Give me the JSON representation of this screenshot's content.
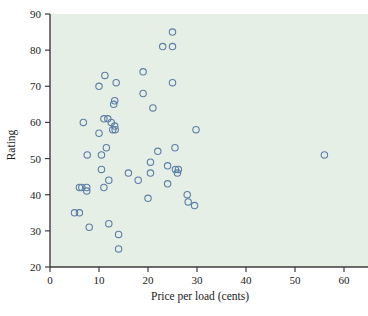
{
  "chart_data": {
    "type": "scatter",
    "title": "",
    "xlabel": "Price per load (cents)",
    "ylabel": "Rating",
    "xlim": [
      0,
      60
    ],
    "ylim": [
      20,
      90
    ],
    "xticks": [
      0,
      10,
      20,
      30,
      40,
      50,
      60
    ],
    "yticks": [
      20,
      30,
      40,
      50,
      60,
      70,
      80,
      90
    ],
    "grid": false,
    "legend": null,
    "marker_style": "open-circle",
    "marker_color": "#5b7fa6",
    "plot_background": "#e6efe6",
    "points": [
      {
        "x": 5,
        "y": 35
      },
      {
        "x": 6,
        "y": 35
      },
      {
        "x": 6,
        "y": 42
      },
      {
        "x": 6.5,
        "y": 42
      },
      {
        "x": 6.8,
        "y": 60
      },
      {
        "x": 7.5,
        "y": 42
      },
      {
        "x": 7.5,
        "y": 41
      },
      {
        "x": 7.6,
        "y": 51
      },
      {
        "x": 8,
        "y": 31
      },
      {
        "x": 10,
        "y": 57
      },
      {
        "x": 10,
        "y": 70
      },
      {
        "x": 10.5,
        "y": 51
      },
      {
        "x": 10.5,
        "y": 47
      },
      {
        "x": 11,
        "y": 42
      },
      {
        "x": 11,
        "y": 61
      },
      {
        "x": 11.2,
        "y": 73
      },
      {
        "x": 11.5,
        "y": 53
      },
      {
        "x": 11.8,
        "y": 61
      },
      {
        "x": 12,
        "y": 44
      },
      {
        "x": 12,
        "y": 32
      },
      {
        "x": 12.5,
        "y": 60
      },
      {
        "x": 12.8,
        "y": 58
      },
      {
        "x": 13,
        "y": 65
      },
      {
        "x": 13.2,
        "y": 66
      },
      {
        "x": 13.2,
        "y": 59
      },
      {
        "x": 13.3,
        "y": 58
      },
      {
        "x": 13.5,
        "y": 71
      },
      {
        "x": 14,
        "y": 29
      },
      {
        "x": 14,
        "y": 25
      },
      {
        "x": 16,
        "y": 46
      },
      {
        "x": 18,
        "y": 44
      },
      {
        "x": 19,
        "y": 68
      },
      {
        "x": 19,
        "y": 74
      },
      {
        "x": 20,
        "y": 39
      },
      {
        "x": 20.5,
        "y": 49
      },
      {
        "x": 20.5,
        "y": 46
      },
      {
        "x": 21,
        "y": 64
      },
      {
        "x": 22,
        "y": 52
      },
      {
        "x": 23,
        "y": 81
      },
      {
        "x": 24,
        "y": 48
      },
      {
        "x": 24,
        "y": 43
      },
      {
        "x": 25,
        "y": 85
      },
      {
        "x": 25,
        "y": 81
      },
      {
        "x": 25,
        "y": 71
      },
      {
        "x": 25.5,
        "y": 53
      },
      {
        "x": 25.6,
        "y": 47
      },
      {
        "x": 26,
        "y": 46
      },
      {
        "x": 26.2,
        "y": 47
      },
      {
        "x": 28,
        "y": 40
      },
      {
        "x": 28.2,
        "y": 38
      },
      {
        "x": 29.5,
        "y": 37
      },
      {
        "x": 29.8,
        "y": 58
      },
      {
        "x": 56,
        "y": 51
      }
    ]
  }
}
